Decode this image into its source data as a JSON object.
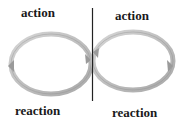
{
  "diagram": {
    "labels": {
      "top_left": "action",
      "top_right": "action",
      "bottom_left": "reaction",
      "bottom_right": "reaction"
    },
    "colors": {
      "loop_fill": "#c8c8c8",
      "loop_stroke": "#8a8a8a",
      "divider": "#222222",
      "text": "#1a1a1a"
    }
  }
}
